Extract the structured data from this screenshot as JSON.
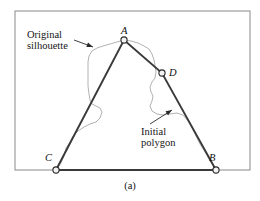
{
  "figure": {
    "caption": "(a)",
    "frame": {
      "x": 15,
      "y": 11,
      "width": 235,
      "height": 159,
      "color": "#8a8a8a"
    },
    "annotations": [
      {
        "id": "original-silhouette",
        "line1": "Original",
        "line2": "silhouette",
        "arrow_from": [
          74,
          40
        ],
        "arrow_to": [
          93,
          47
        ]
      },
      {
        "id": "initial-polygon",
        "line1": "Initial",
        "line2": "polygon",
        "arrow_from": [
          150,
          124
        ],
        "arrow_to": [
          172,
          110
        ]
      }
    ],
    "vertices": [
      {
        "label": "A",
        "x": 124,
        "y": 40
      },
      {
        "label": "D",
        "x": 162,
        "y": 73
      },
      {
        "label": "C",
        "x": 56,
        "y": 170
      },
      {
        "label": "B",
        "x": 216,
        "y": 170
      }
    ],
    "polygon": {
      "name": "initial-polygon",
      "color": "#3a3a3a",
      "width": 1.9,
      "path": "M 56 170 L 124 40 L 162 73 L 216 170 L 56 170"
    },
    "silhouette": {
      "name": "original-silhouette",
      "color": "#a9a9a9",
      "width": 0.9,
      "path": "M 56 170 L 61 163 L 64 156 L 66 148 L 70 142 L 73 136 L 78 131 L 84 127 L 90 124 L 96 122 L 100 118 L 102 112 L 100 108 L 96 106 L 92 104 L 90 100 L 89 94 L 88 86 L 88 78 L 88 70 L 88 62 L 89 56 L 92 51 L 97 48 L 103 46 L 110 44 L 117 42 L 124 40 L 131 41 L 138 43 L 144 46 L 149 49 L 152 54 L 154 60 L 155 66 L 156 72 L 155 78 L 152 82 L 150 87 L 151 92 L 153 96 L 152 101 L 150 106 L 152 111 L 157 114 L 163 115 L 170 114 L 177 113 L 183 115 L 188 121 L 192 128 L 196 136 L 200 144 L 205 152 L 210 161 L 216 170"
    }
  }
}
